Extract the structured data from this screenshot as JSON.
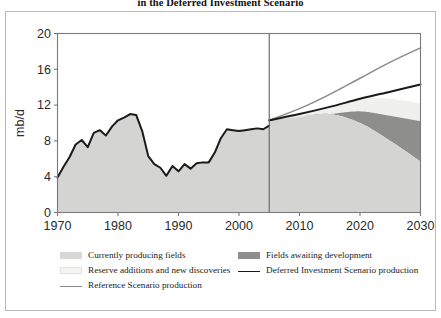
{
  "figure": {
    "title": "in the Deferred Investment Scenario"
  },
  "chart_data": {
    "type": "area",
    "title": "in the Deferred Investment Scenario",
    "xlabel": "",
    "ylabel": "mb/d",
    "xlim": [
      1970,
      2030
    ],
    "ylim": [
      0,
      20
    ],
    "xticks": [
      1970,
      1980,
      1990,
      2000,
      2010,
      2020,
      2030
    ],
    "yticks": [
      0,
      4,
      8,
      12,
      16,
      20
    ],
    "grid": false,
    "legend_position": "bottom",
    "divider_year": 2005,
    "colors": {
      "currently_producing_fields": "#d4d4d2",
      "fields_awaiting_development": "#8e8e8c",
      "reserve_additions_and_new_discoveries": "#f0f0ee",
      "deferred_investment_scenario_production": "#1a1a1a",
      "reference_scenario_production": "#8a8a88",
      "axis": "#7a7a7a",
      "divider": "#6d6d6d"
    },
    "history": {
      "name": "Historical production",
      "x": [
        1970,
        1971,
        1972,
        1973,
        1974,
        1975,
        1976,
        1977,
        1978,
        1979,
        1980,
        1981,
        1982,
        1983,
        1984,
        1985,
        1986,
        1987,
        1988,
        1989,
        1990,
        1991,
        1992,
        1993,
        1994,
        1995,
        1996,
        1997,
        1998,
        1999,
        2000,
        2001,
        2002,
        2003,
        2004,
        2005
      ],
      "y": [
        3.9,
        5.1,
        6.2,
        7.6,
        8.1,
        7.3,
        8.9,
        9.2,
        8.6,
        9.6,
        10.3,
        10.6,
        11.0,
        10.9,
        9.1,
        6.3,
        5.4,
        5.0,
        4.1,
        5.2,
        4.6,
        5.4,
        4.9,
        5.5,
        5.6,
        5.6,
        6.7,
        8.3,
        9.3,
        9.2,
        9.1,
        9.2,
        9.3,
        9.4,
        9.3,
        9.7
      ]
    },
    "forecast": {
      "x": [
        2005,
        2010,
        2015,
        2020,
        2025,
        2030
      ],
      "series": [
        {
          "name": "Currently producing fields",
          "values": [
            10.3,
            10.7,
            11.0,
            10.0,
            8.0,
            5.7
          ]
        },
        {
          "name": "Fields awaiting development",
          "values": [
            0.0,
            0.0,
            0.0,
            1.3,
            2.8,
            4.5
          ]
        },
        {
          "name": "Reserve additions and new discoveries",
          "values": [
            0.0,
            0.3,
            0.8,
            1.4,
            1.9,
            2.0
          ]
        },
        {
          "name": "Deferred Investment Scenario production",
          "values": [
            10.3,
            11.0,
            11.8,
            12.7,
            13.5,
            14.3
          ]
        },
        {
          "name": "Reference Scenario production",
          "values": [
            10.3,
            11.6,
            13.2,
            15.0,
            16.8,
            18.4
          ]
        }
      ]
    }
  },
  "yaxis": {
    "label": "mb/d",
    "ticks": [
      "20",
      "16",
      "12",
      "8",
      "4",
      "0"
    ]
  },
  "xaxis": {
    "ticks": [
      "1970",
      "1980",
      "1990",
      "2000",
      "2010",
      "2020",
      "2030"
    ]
  },
  "legend": {
    "items": [
      {
        "label": "Currently producing fields",
        "marker": "swatch",
        "color": "#d8d8d6"
      },
      {
        "label": "Fields awaiting development",
        "marker": "swatch",
        "color": "#8e8e8c"
      },
      {
        "label": "Reserve additions and new discoveries",
        "marker": "swatch",
        "color": "#f4f4f2"
      },
      {
        "label": "Deferred Investment Scenario production",
        "marker": "line",
        "color": "#1a1a1a"
      },
      {
        "label": "Reference Scenario production",
        "marker": "line",
        "color": "#8a8a88"
      }
    ]
  }
}
